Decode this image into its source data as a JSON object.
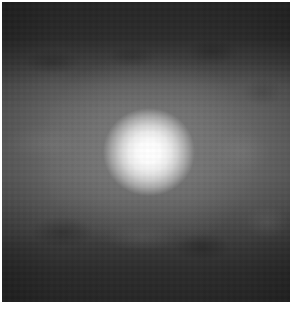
{
  "image": {
    "description": "grayscale image of a bright diffuse point source on a noisy gray background",
    "palette": {
      "border": "#ffffff",
      "dark_band": "#262626",
      "mid_band": "#6c6c6c",
      "core": "#ffffff"
    },
    "bright_spot": {
      "center_x": 148,
      "center_y": 152,
      "core_radius": 22,
      "glow_radius": 48
    }
  }
}
